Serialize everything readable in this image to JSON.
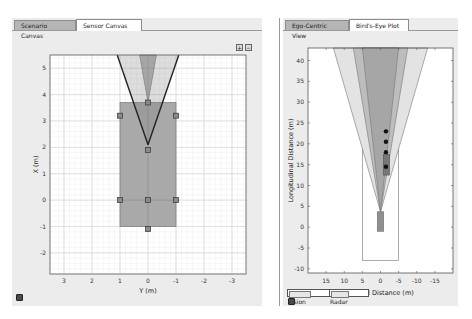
{
  "left": {
    "tabs": [
      {
        "label": "Scenario Canvas",
        "active": false
      },
      {
        "label": "Sensor Canvas",
        "active": true
      }
    ],
    "buttons": {
      "zoom_in": "+",
      "zoom_out": "−"
    }
  },
  "right": {
    "tabs": [
      {
        "label": "Ego-Centric View",
        "active": false
      },
      {
        "label": "Bird's-Eye Plot",
        "active": true
      }
    ]
  },
  "chart_data": [
    {
      "type": "scatter",
      "title": "Sensor Canvas",
      "xlabel": "Y (m)",
      "ylabel": "X (m)",
      "xlim": [
        3.5,
        -3.5
      ],
      "ylim": [
        -2.8,
        5.5
      ],
      "xticks": [
        3,
        2,
        1,
        0,
        -1,
        -2,
        -3
      ],
      "yticks": [
        5,
        4,
        3,
        2,
        1,
        0,
        -1,
        -2
      ],
      "grid": true,
      "ego_vehicle": {
        "y_range": [
          -1,
          1
        ],
        "x_range": [
          -1,
          3.7
        ]
      },
      "mount_points": [
        [
          0,
          3.7
        ],
        [
          1,
          3.2
        ],
        [
          -1,
          3.2
        ],
        [
          0,
          1.9
        ],
        [
          1,
          0
        ],
        [
          0,
          0
        ],
        [
          -1,
          0
        ],
        [
          0,
          -1.1
        ]
      ],
      "sensors": [
        {
          "name": "Vision",
          "apex": [
            0,
            2.1
          ],
          "fov_edges_at_x5.5": [
            1.1,
            -1.1
          ]
        },
        {
          "name": "Radar",
          "apex": [
            0,
            3.7
          ],
          "fov_edges_at_x5.5": [
            0.3,
            -0.3
          ]
        }
      ]
    },
    {
      "type": "scatter",
      "title": "Bird's-Eye Plot",
      "xlabel": "Lateral Distance (m)",
      "ylabel": "Longitudinal Distance (m)",
      "xlim": [
        20,
        -20
      ],
      "ylim": [
        -11,
        43
      ],
      "xticks": [
        15,
        10,
        5,
        0,
        -5,
        -10,
        -15
      ],
      "yticks": [
        40,
        35,
        30,
        25,
        20,
        15,
        10,
        5,
        0,
        -5,
        -10
      ],
      "coverage_areas": [
        {
          "name": "Vision",
          "apex": [
            0,
            3.7
          ],
          "half_width_at_43": 13
        },
        {
          "name": "Radar",
          "apex": [
            0,
            3.7
          ],
          "half_width_at_43": 5
        }
      ],
      "detections": [
        [
          -1.5,
          23
        ],
        [
          -1.5,
          20.5
        ],
        [
          -1.5,
          18
        ],
        [
          -1.5,
          14.5
        ]
      ],
      "target_vehicle": {
        "y_range": [
          -2.5,
          -0.8
        ],
        "x_range": [
          12.5,
          17.5
        ]
      },
      "ego_vehicle": {
        "y_range": [
          -0.9,
          0.9
        ],
        "x_range": [
          -1,
          3.7
        ]
      },
      "legend": [
        "Vision",
        "Radar"
      ],
      "legend_position": "bottom-left"
    }
  ]
}
